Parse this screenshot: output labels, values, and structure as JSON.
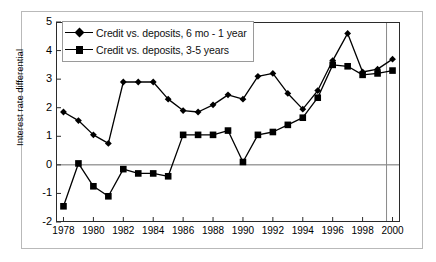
{
  "chart_data": {
    "type": "line",
    "title": "",
    "xlabel": "",
    "ylabel": "Interest rate differential",
    "xlim": [
      1977.5,
      2000.5
    ],
    "ylim": [
      -2,
      5
    ],
    "yticks": [
      5,
      4,
      3,
      2,
      1,
      0,
      -1,
      -2
    ],
    "xticks": [
      1978,
      1980,
      1982,
      1984,
      1986,
      1988,
      1990,
      1992,
      1994,
      1996,
      1998,
      2000
    ],
    "grid": false,
    "legend_position": "top-left",
    "x": [
      1978,
      1979,
      1980,
      1981,
      1982,
      1983,
      1984,
      1985,
      1986,
      1987,
      1988,
      1989,
      1990,
      1991,
      1992,
      1993,
      1994,
      1995,
      1996,
      1997,
      1998,
      1999,
      2000
    ],
    "series": [
      {
        "name": "Credit vs. deposits, 6 mo - 1 year",
        "marker": "diamond",
        "color": "#000000",
        "values": [
          1.85,
          1.55,
          1.05,
          0.75,
          2.9,
          2.9,
          2.9,
          2.3,
          1.9,
          1.85,
          2.1,
          2.45,
          2.3,
          3.1,
          3.2,
          2.5,
          1.95,
          2.6,
          3.65,
          4.6,
          3.25,
          3.35,
          3.7
        ]
      },
      {
        "name": "Credit vs. deposits, 3-5 years",
        "marker": "square",
        "color": "#000000",
        "values": [
          -1.45,
          0.05,
          -0.75,
          -1.1,
          -0.15,
          -0.3,
          -0.3,
          -0.4,
          1.05,
          1.05,
          1.05,
          1.2,
          0.1,
          1.05,
          1.15,
          1.4,
          1.65,
          2.35,
          3.5,
          3.45,
          3.15,
          3.2,
          3.3
        ]
      }
    ]
  },
  "legend": {
    "items": [
      {
        "label": "Credit vs. deposits, 6 mo - 1 year",
        "marker": "diamond"
      },
      {
        "label": "Credit vs. deposits, 3-5 years",
        "marker": "square"
      }
    ]
  },
  "axes": {
    "y_title": "Interest rate differential",
    "y_labels": [
      "5",
      "4",
      "3",
      "2",
      "1",
      "0",
      "-1",
      "-2"
    ],
    "x_labels": [
      "1978",
      "1980",
      "1982",
      "1984",
      "1986",
      "1988",
      "1990",
      "1992",
      "1994",
      "1996",
      "1998",
      "2000"
    ]
  }
}
